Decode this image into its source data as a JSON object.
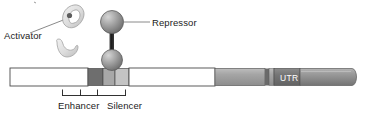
{
  "figure": {
    "width": 370,
    "height": 116,
    "background": "#ffffff"
  },
  "labels": {
    "activator": "Activator",
    "repressor": "Repressor",
    "enhancer": "Enhancer",
    "silencer": "Silencer",
    "utr": "UTR"
  },
  "colors": {
    "text": "#1b1b1b",
    "outline": "#4a4a4a",
    "leader_line": "#8a8a8a",
    "bar_white": "#ffffff",
    "enhancer_dark": "#6e6e6e",
    "mid_gray": "#a8a8a8",
    "silencer_light": "#c4c4c4",
    "exon_gray": "#9a9a9a",
    "utr_box": "#6f6f6f",
    "cds_gray": "#8c8c8c",
    "protein_light": "#d8d8d8",
    "sphere_gray": "#9c9c9c",
    "linker_dark": "#262626"
  },
  "elements": {
    "activator_shapes": [
      {
        "name": "activator-crescent-upper",
        "cx": 72,
        "cy": 18
      },
      {
        "name": "activator-crescent-lower",
        "cx": 66,
        "cy": 48
      }
    ],
    "repressor": {
      "upper_sphere": {
        "cx": 112,
        "cy": 23,
        "r": 11
      },
      "lower_sphere": {
        "cx": 112,
        "cy": 60,
        "r": 10
      },
      "linker": {
        "x": 110,
        "y": 33,
        "w": 4,
        "h": 18
      }
    },
    "dna_bar": {
      "x": 10,
      "y": 68,
      "width": 348,
      "height": 18,
      "segments": [
        {
          "name": "upstream-white",
          "x": 10,
          "w": 78,
          "fill": "#ffffff"
        },
        {
          "name": "enhancer-block",
          "x": 88,
          "w": 15,
          "fill": "#6e6e6e"
        },
        {
          "name": "spacer-block",
          "x": 103,
          "w": 12,
          "fill": "#a8a8a8"
        },
        {
          "name": "silencer-block",
          "x": 115,
          "w": 14,
          "fill": "#c4c4c4"
        },
        {
          "name": "intergenic-white",
          "x": 129,
          "w": 86,
          "fill": "#ffffff"
        },
        {
          "name": "exon-gray",
          "x": 215,
          "w": 50,
          "fill": "#9a9a9a"
        },
        {
          "name": "divider-dark",
          "x": 265,
          "w": 4,
          "fill": "#6a6a6a"
        },
        {
          "name": "short-gray",
          "x": 269,
          "w": 5,
          "fill": "#9a9a9a"
        },
        {
          "name": "utr-box",
          "x": 274,
          "w": 26,
          "fill": "#6f6f6f"
        },
        {
          "name": "cds-cylinder",
          "x": 300,
          "w": 58,
          "fill": "#8c8c8c"
        }
      ]
    },
    "bracket": {
      "baseline_y": 95,
      "x_start": 62,
      "x_end": 126,
      "ticks": [
        62,
        80,
        97,
        126
      ]
    },
    "leader_lines": [
      {
        "name": "activator-leader",
        "x1": 30,
        "y1": 32,
        "x2": 70,
        "y2": 16
      },
      {
        "name": "repressor-leader",
        "x1": 123,
        "y1": 22,
        "x2": 150,
        "y2": 22
      }
    ]
  }
}
